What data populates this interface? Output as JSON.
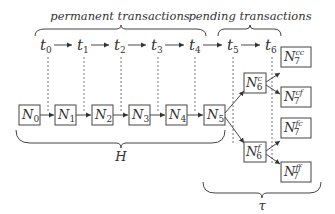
{
  "diagram": {
    "captions": {
      "permanent": "permanent transactions",
      "pending": "pending transactions",
      "history": "H",
      "tau": "τ"
    },
    "time_steps": [
      {
        "base": "t",
        "sub": "0"
      },
      {
        "base": "t",
        "sub": "1"
      },
      {
        "base": "t",
        "sub": "2"
      },
      {
        "base": "t",
        "sub": "3"
      },
      {
        "base": "t",
        "sub": "4"
      },
      {
        "base": "t",
        "sub": "5"
      },
      {
        "base": "t",
        "sub": "6"
      }
    ],
    "chain_nodes": [
      {
        "base": "N",
        "sub": "0"
      },
      {
        "base": "N",
        "sub": "1"
      },
      {
        "base": "N",
        "sub": "2"
      },
      {
        "base": "N",
        "sub": "3"
      },
      {
        "base": "N",
        "sub": "4"
      },
      {
        "base": "N",
        "sub": "5"
      }
    ],
    "branch_nodes": {
      "n6c": {
        "base": "N",
        "sub": "6",
        "sup": "c"
      },
      "n6f": {
        "base": "N",
        "sub": "6",
        "sup": "f"
      },
      "n7cc": {
        "base": "N",
        "sub": "7",
        "sup": "cc"
      },
      "n7cf": {
        "base": "N",
        "sub": "7",
        "sup": "cf"
      },
      "n7fc": {
        "base": "N",
        "sub": "7",
        "sup": "fc"
      },
      "n7ff": {
        "base": "N",
        "sub": "7",
        "sup": "ff"
      }
    },
    "colors": {
      "stroke": "#444444",
      "text": "#333333",
      "background": "#ffffff"
    }
  }
}
